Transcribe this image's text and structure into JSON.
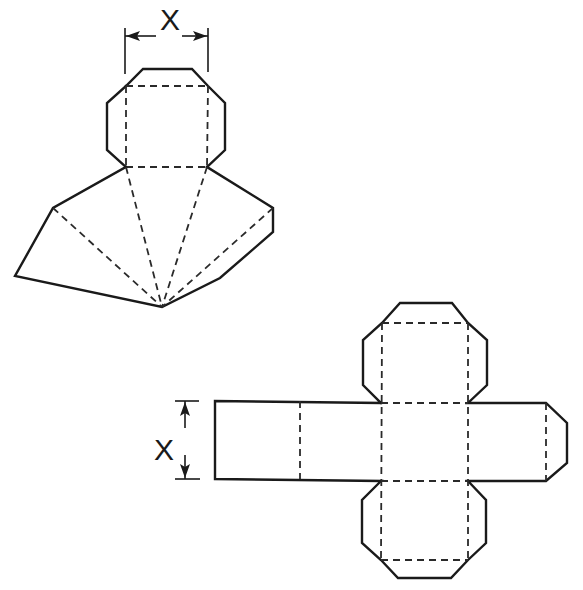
{
  "figure": {
    "colors": {
      "line": "#1a1a1a",
      "background": "#ffffff"
    }
  },
  "net_top": {
    "dimension_label": "X",
    "dimension_orientation": "horizontal"
  },
  "net_bottom": {
    "dimension_label": "X",
    "dimension_orientation": "vertical"
  }
}
